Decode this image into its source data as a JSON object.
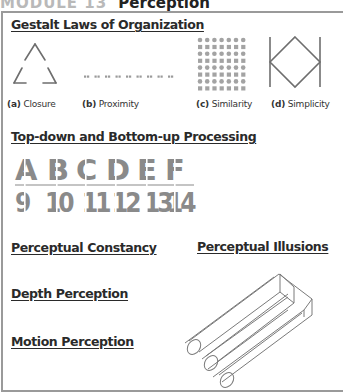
{
  "header": {
    "module_label": "MODULE 13",
    "title": "Perception"
  },
  "sections": {
    "gestalt": {
      "title": "Gestalt Laws of Organization",
      "figures": [
        {
          "letter": "(a)",
          "label": "Closure",
          "icon": "broken-triangle-icon"
        },
        {
          "letter": "(b)",
          "label": "Proximity",
          "icon": "paired-dots-icon"
        },
        {
          "letter": "(c)",
          "label": "Similarity",
          "icon": "dot-grid-icon"
        },
        {
          "letter": "(d)",
          "label": "Simplicity",
          "icon": "diamond-between-bars-icon"
        }
      ]
    },
    "processing": {
      "title": "Top-down and Bottom-up Processing",
      "letters": [
        "A",
        "B",
        "C",
        "D",
        "E",
        "F"
      ],
      "numbers": [
        "9",
        "10",
        "11",
        "12",
        "13",
        "14"
      ]
    },
    "constancy": {
      "title": "Perceptual Constancy"
    },
    "illusions": {
      "title": "Perceptual Illusions",
      "icon": "impossible-trident-icon"
    },
    "depth": {
      "title": "Depth Perception"
    },
    "motion": {
      "title": "Motion Perception"
    }
  },
  "colors": {
    "module_label": "#b9b9b9",
    "figure_stroke": "#6e6e6e",
    "stencil_fill": "#8a8a8a",
    "frame_border": "#9a9a9a"
  }
}
